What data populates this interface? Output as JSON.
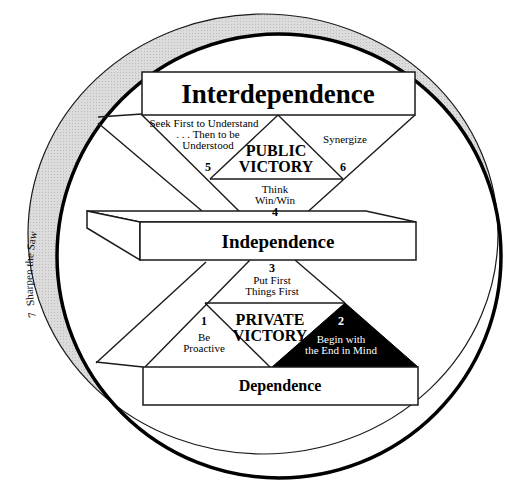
{
  "diagram": {
    "levels": {
      "interdependence": "Interdependence",
      "independence": "Independence",
      "dependence": "Dependence"
    },
    "victories": {
      "public": {
        "line1": "PUBLIC",
        "line2": "VICTORY"
      },
      "private": {
        "line1": "PRIVATE",
        "line2": "VICTORY"
      }
    },
    "habits": [
      {
        "number": "1",
        "line1": "Be",
        "line2": "Proactive"
      },
      {
        "number": "2",
        "line1": "Begin with",
        "line2": "the End in Mind"
      },
      {
        "number": "3",
        "line1": "Put First",
        "line2": "Things First"
      },
      {
        "number": "4",
        "line1": "Think",
        "line2": "Win/Win"
      },
      {
        "number": "5",
        "line1": "Seek First to Understand",
        "line2": ". . . Then to be",
        "line3": "Understood"
      },
      {
        "number": "6",
        "line1": "Synergize"
      },
      {
        "number": "7",
        "label": "Sharpen the Saw"
      }
    ],
    "colors": {
      "line": "#1a1a1a",
      "ring_fill": "#d9d9d9",
      "habit2_fill": "#000000",
      "background": "#ffffff"
    }
  }
}
